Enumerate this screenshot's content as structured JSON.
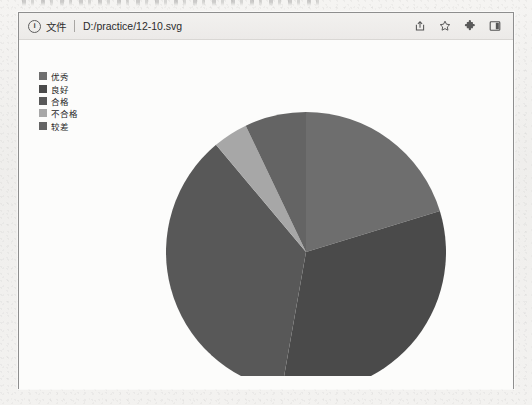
{
  "page": {
    "background_color": "#f2f1ef",
    "top_text_fragment": ""
  },
  "browser": {
    "address_bar": {
      "info_icon": "info-circle-icon",
      "scheme_label": "文件",
      "url": "D:/practice/12-10.svg"
    },
    "toolbar_icons": [
      {
        "name": "share-install-icon",
        "label": ""
      },
      {
        "name": "bookmark-star-icon",
        "label": ""
      },
      {
        "name": "extensions-puzzle-icon",
        "label": ""
      },
      {
        "name": "side-panel-icon",
        "label": ""
      }
    ]
  },
  "chart_data": {
    "type": "pie",
    "title": "",
    "xlabel": "",
    "ylabel": "",
    "legend_position": "top-left",
    "grid": false,
    "categories": [
      "优秀",
      "良好",
      "合格",
      "不合格",
      "较差"
    ],
    "values": [
      20.3,
      32.5,
      36.1,
      4.0,
      7.1
    ],
    "colors": [
      "#6e6e6e",
      "#4a4a4a",
      "#585858",
      "#a7a7a7",
      "#646464"
    ],
    "start_angle_deg": 0,
    "direction": "clockwise",
    "slices": [
      {
        "label": "优秀",
        "value": 20.3,
        "color": "#6e6e6e",
        "start_deg": 0,
        "end_deg": 73
      },
      {
        "label": "良好",
        "value": 32.5,
        "color": "#4a4a4a",
        "start_deg": 73,
        "end_deg": 190
      },
      {
        "label": "合格",
        "value": 36.1,
        "color": "#585858",
        "start_deg": 190,
        "end_deg": 320
      },
      {
        "label": "不合格",
        "value": 4.0,
        "color": "#a7a7a7",
        "start_deg": 320,
        "end_deg": 334.5
      },
      {
        "label": "较差",
        "value": 7.1,
        "color": "#646464",
        "start_deg": 334.5,
        "end_deg": 360
      }
    ],
    "center": {
      "x": 159,
      "y": 166
    },
    "radius": 140
  }
}
